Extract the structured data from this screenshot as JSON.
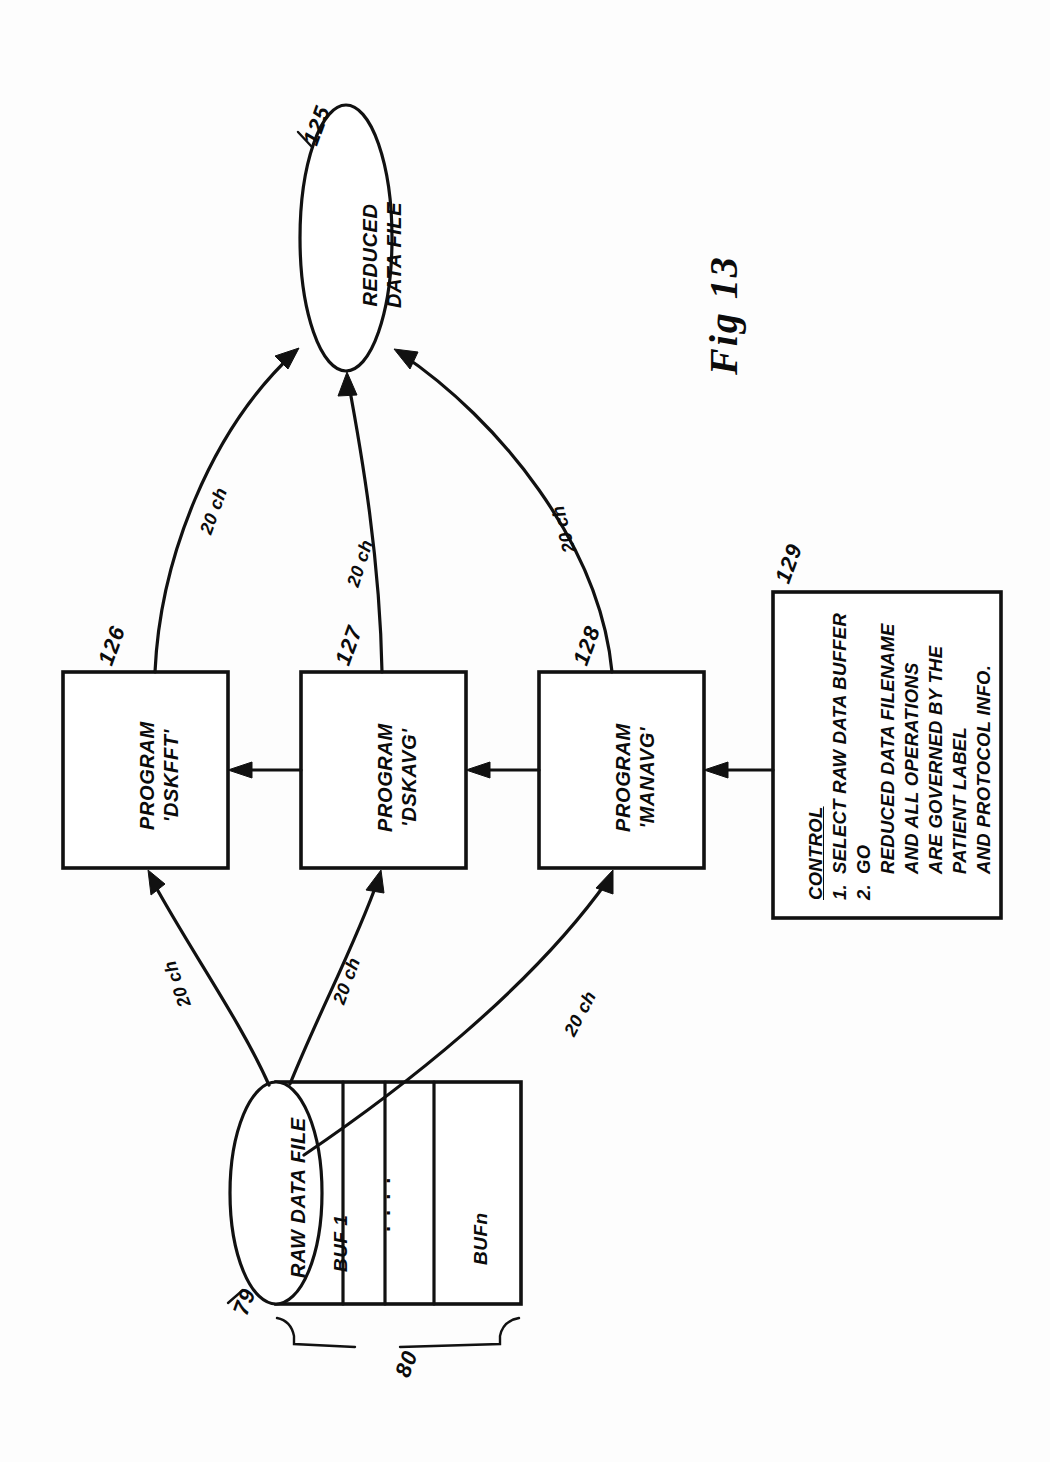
{
  "figure": {
    "title": "Fig 13",
    "kind": "patent-flow-diagram",
    "orientation": "landscape-rotated-90",
    "ink_color": "#111111",
    "paper_color": "#ffffff"
  },
  "nodes": {
    "reduced_data_file": {
      "ref": "125",
      "shape": "ellipse",
      "line1": "REDUCED",
      "line2": "DATA FILE"
    },
    "program_dskfft": {
      "ref": "126",
      "shape": "rect",
      "line1": "PROGRAM",
      "line2": "'DSKFFT'"
    },
    "program_dskavg": {
      "ref": "127",
      "shape": "rect",
      "line1": "PROGRAM",
      "line2": "'DSKAVG'"
    },
    "program_manavg": {
      "ref": "128",
      "shape": "rect",
      "line1": "PROGRAM",
      "line2": "'MANAVG'"
    },
    "control": {
      "ref": "129",
      "shape": "rect",
      "heading": "CONTROL",
      "items": [
        {
          "num": "1.",
          "text": "SELECT RAW DATA BUFFER"
        },
        {
          "num": "2.",
          "text": "GO"
        }
      ],
      "note": [
        "REDUCED DATA FILENAME",
        "AND ALL OPERATIONS",
        "ARE GOVERNED BY THE",
        "PATIENT LABEL",
        "AND PROTOCOL INFO."
      ]
    },
    "raw_data_file": {
      "ref": "79",
      "shape": "cylinder",
      "label": "RAW DATA FILE"
    },
    "buffers": {
      "ref": "80",
      "first": "BUF 1",
      "last": "BUFn",
      "ellipsis": "...."
    }
  },
  "edges": [
    {
      "from": "program_dskfft",
      "to": "reduced_data_file",
      "label": "20 ch"
    },
    {
      "from": "program_dskavg",
      "to": "reduced_data_file",
      "label": "20 ch"
    },
    {
      "from": "program_manavg",
      "to": "reduced_data_file",
      "label": "20 ch"
    },
    {
      "from": "raw_data_file",
      "to": "program_dskfft",
      "label": "20 ch"
    },
    {
      "from": "raw_data_file",
      "to": "program_dskavg",
      "label": "20 ch"
    },
    {
      "from": "raw_data_file",
      "to": "program_manavg",
      "label": "20 ch"
    },
    {
      "from": "control",
      "to": "program_manavg",
      "label": ""
    },
    {
      "from": "program_manavg",
      "to": "program_dskavg",
      "label": ""
    },
    {
      "from": "program_dskavg",
      "to": "program_dskfft",
      "label": ""
    }
  ],
  "edge_labels": {
    "fft_to_reduced": "20 ch",
    "avg_to_reduced": "20 ch",
    "man_to_reduced": "20 ch",
    "raw_to_fft": "20 ch",
    "raw_to_avg": "20 ch",
    "raw_to_man": "20 ch"
  }
}
